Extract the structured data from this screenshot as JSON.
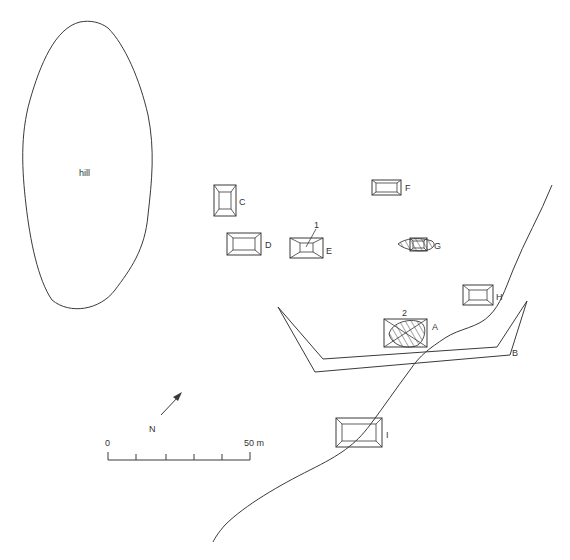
{
  "map": {
    "hill_label": "hill",
    "structures": [
      {
        "id": "A",
        "label": "A"
      },
      {
        "id": "C",
        "label": "C"
      },
      {
        "id": "D",
        "label": "D"
      },
      {
        "id": "E",
        "label": "E"
      },
      {
        "id": "F",
        "label": "F"
      },
      {
        "id": "G",
        "label": "G"
      },
      {
        "id": "H",
        "label": "H"
      },
      {
        "id": "I",
        "label": "I"
      }
    ],
    "enclosure_label": "B",
    "features": [
      {
        "id": "1",
        "label": "1"
      },
      {
        "id": "2",
        "label": "2"
      }
    ],
    "north_label": "N",
    "scale": {
      "start_label": "0",
      "end_label": "50 m",
      "ticks": 6
    }
  }
}
